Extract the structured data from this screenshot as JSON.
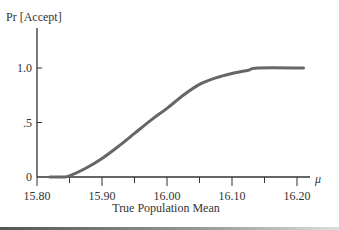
{
  "chart_data": {
    "type": "line",
    "title": "",
    "xlabel": "True Population Mean",
    "ylabel": "Pr [Accept]",
    "x_axis_symbol": "μ",
    "xlim": [
      15.8,
      16.21
    ],
    "ylim": [
      0,
      1.2
    ],
    "x_ticks": [
      "15.80",
      "15.90",
      "16.00",
      "16.10",
      "16.20"
    ],
    "y_ticks": [
      "0",
      ".5",
      "1.0"
    ],
    "grid": false,
    "series": [
      {
        "name": "Operating characteristic curve",
        "color": "#666666",
        "x": [
          15.82,
          15.84,
          15.85,
          15.875,
          15.9,
          15.925,
          15.95,
          15.975,
          16.0,
          16.025,
          16.05,
          16.075,
          16.1,
          16.125,
          16.14,
          16.21
        ],
        "y": [
          0.0,
          0.0,
          0.01,
          0.08,
          0.17,
          0.28,
          0.4,
          0.52,
          0.63,
          0.75,
          0.85,
          0.91,
          0.95,
          0.98,
          1.0,
          1.0
        ]
      }
    ]
  }
}
